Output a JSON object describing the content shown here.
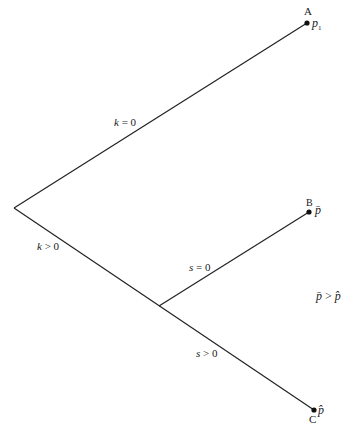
{
  "tree": {
    "nodes": {
      "A": {
        "letter": "A",
        "value": "p",
        "subscript": "1"
      },
      "B": {
        "letter": "B",
        "value": "p̄"
      },
      "C": {
        "letter": "C",
        "value": "p̂"
      }
    },
    "edges": {
      "k_zero": {
        "var": "k",
        "rel": " = 0"
      },
      "k_pos": {
        "var": "k",
        "rel": " > 0"
      },
      "s_zero": {
        "var": "s",
        "rel": " = 0"
      },
      "s_pos": {
        "var": "s",
        "rel": " > 0"
      }
    },
    "note": {
      "lhs": "p̄",
      "op": " > ",
      "rhs": "p̂"
    }
  }
}
